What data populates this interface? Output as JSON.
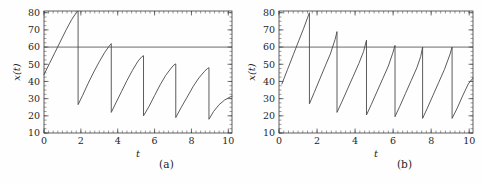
{
  "figure": {
    "background_color": "#fefefe",
    "curve_color": "#4a4a4a",
    "threshold_color": "#5a5a5a",
    "axis_color": "#3b3b3b"
  },
  "panels": [
    {
      "id": "a",
      "caption": "(a)",
      "xlabel": "t",
      "ylabel": "x(t)",
      "xticks": [
        0,
        2,
        4,
        6,
        8,
        10
      ],
      "yticks": [
        10,
        20,
        30,
        40,
        50,
        60,
        70,
        80
      ],
      "xtick_labels": [
        "0",
        "2",
        "4",
        "6",
        "8",
        "10"
      ],
      "ytick_labels": [
        "10",
        "20",
        "30",
        "40",
        "50",
        "60",
        "70",
        "80"
      ]
    },
    {
      "id": "b",
      "caption": "(b)",
      "xlabel": "t",
      "ylabel": "x(t)",
      "xticks": [
        0,
        2,
        4,
        6,
        8,
        10
      ],
      "yticks": [
        10,
        20,
        30,
        40,
        50,
        60,
        70,
        80
      ],
      "xtick_labels": [
        "0",
        "2",
        "4",
        "6",
        "8",
        "10"
      ],
      "ytick_labels": [
        "10",
        "20",
        "30",
        "40",
        "50",
        "60",
        "70",
        "80"
      ]
    }
  ],
  "chart_data": [
    {
      "type": "line",
      "panel": "a",
      "title": "(a)",
      "xlabel": "t",
      "ylabel": "x(t)",
      "xlim": [
        0,
        10.2
      ],
      "ylim": [
        10,
        81
      ],
      "grid": false,
      "legend": null,
      "xticks": [
        0,
        2,
        4,
        6,
        8,
        10
      ],
      "yticks": [
        10,
        20,
        30,
        40,
        50,
        60,
        70,
        80
      ],
      "series": [
        {
          "name": "threshold",
          "style": "horizontal-line",
          "y_value": 60,
          "x": [
            0,
            10.2
          ],
          "values": [
            60,
            60
          ]
        },
        {
          "name": "x(t)",
          "style": "sawtooth-relaxation",
          "x": [
            0.0,
            0.3,
            0.6,
            0.9,
            1.2,
            1.5,
            1.75,
            1.85,
            1.85,
            2.1,
            2.4,
            2.7,
            3.0,
            3.3,
            3.55,
            3.65,
            3.65,
            3.9,
            4.2,
            4.5,
            4.8,
            5.1,
            5.3,
            5.4,
            5.4,
            5.7,
            6.0,
            6.3,
            6.6,
            6.9,
            7.05,
            7.15,
            7.15,
            7.45,
            7.8,
            8.1,
            8.4,
            8.7,
            8.88,
            8.95,
            8.95,
            9.2,
            9.5,
            9.8,
            10.1,
            10.2
          ],
          "values": [
            44.0,
            50.5,
            57.0,
            63.5,
            70.0,
            76.0,
            80.0,
            81.0,
            26.5,
            32.0,
            39.0,
            45.5,
            51.5,
            57.0,
            60.8,
            62.0,
            22.0,
            27.5,
            34.0,
            40.5,
            46.5,
            51.8,
            54.3,
            55.0,
            20.0,
            25.5,
            31.8,
            38.0,
            43.5,
            47.8,
            49.6,
            50.2,
            19.0,
            25.0,
            31.5,
            37.2,
            42.0,
            45.8,
            47.6,
            48.0,
            18.0,
            22.5,
            26.5,
            29.2,
            31.0,
            31.4
          ]
        }
      ]
    },
    {
      "type": "line",
      "panel": "b",
      "title": "(b)",
      "xlabel": "t",
      "ylabel": "x(t)",
      "xlim": [
        0,
        10.2
      ],
      "ylim": [
        10,
        81
      ],
      "grid": false,
      "legend": null,
      "xticks": [
        0,
        2,
        4,
        6,
        8,
        10
      ],
      "yticks": [
        10,
        20,
        30,
        40,
        50,
        60,
        70,
        80
      ],
      "series": [
        {
          "name": "threshold",
          "style": "horizontal-line",
          "y_value": 60,
          "x": [
            0,
            10.2
          ],
          "values": [
            60,
            60
          ]
        },
        {
          "name": "x(t)",
          "style": "sawtooth-relaxation",
          "x": [
            0.15,
            0.45,
            0.75,
            1.05,
            1.3,
            1.5,
            1.6,
            1.6,
            1.85,
            2.15,
            2.45,
            2.7,
            2.95,
            3.05,
            3.05,
            3.3,
            3.6,
            3.9,
            4.2,
            4.45,
            4.6,
            4.6,
            4.85,
            5.15,
            5.45,
            5.75,
            5.98,
            6.1,
            6.1,
            6.35,
            6.65,
            6.95,
            7.25,
            7.45,
            7.55,
            7.55,
            7.8,
            8.1,
            8.4,
            8.7,
            8.98,
            9.1,
            9.1,
            9.35,
            9.65,
            9.95,
            10.2
          ],
          "values": [
            38.5,
            47.0,
            55.5,
            64.0,
            71.0,
            77.0,
            80.0,
            27.0,
            33.5,
            41.5,
            49.5,
            56.0,
            64.5,
            69.0,
            22.0,
            28.0,
            35.5,
            43.0,
            50.5,
            57.5,
            64.0,
            20.5,
            26.5,
            34.0,
            41.5,
            49.0,
            56.5,
            61.0,
            19.5,
            25.5,
            33.0,
            40.5,
            48.0,
            54.5,
            60.0,
            18.5,
            24.5,
            32.0,
            39.5,
            47.0,
            55.5,
            60.0,
            18.5,
            24.0,
            31.5,
            38.5,
            42.0
          ]
        }
      ]
    }
  ]
}
